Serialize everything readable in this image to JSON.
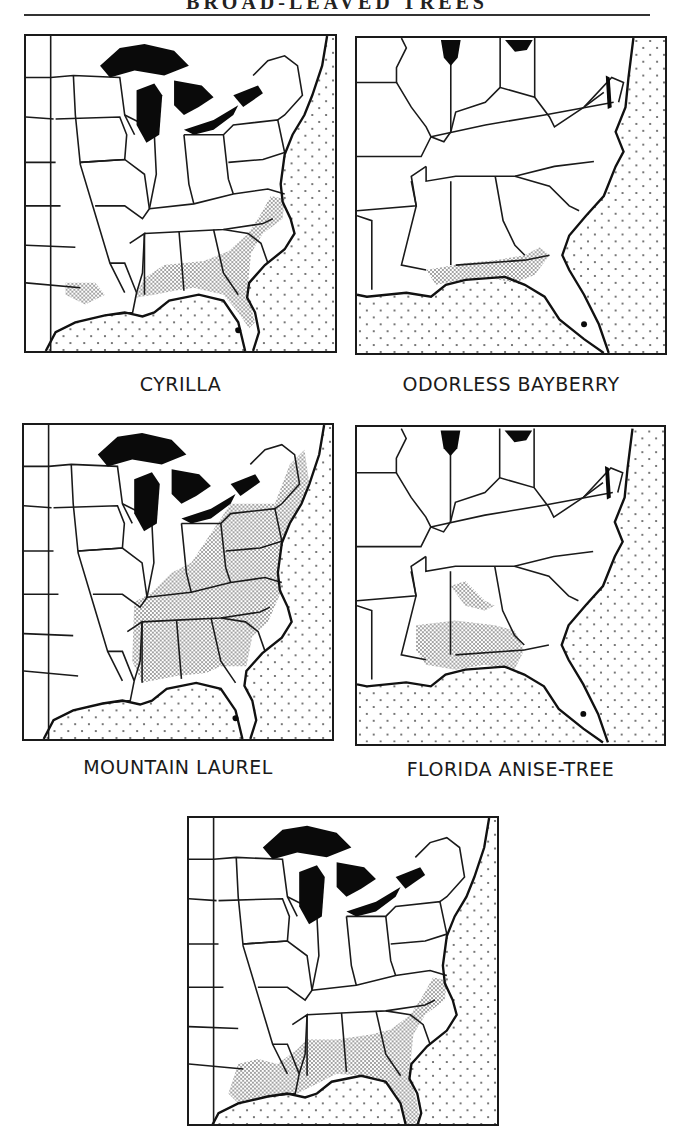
{
  "header": {
    "title": "BROAD-LEAVED TREES"
  },
  "colors": {
    "ink": "#1a1a1a",
    "paper": "#ffffff",
    "range_stipple": "#8a8a8a",
    "ocean_dots": "#555555"
  },
  "legend_semantics": {
    "dense_stipple": "species range",
    "sparse_dots": "ocean / water",
    "solid_black": "Great Lakes and lakes"
  },
  "maps": [
    {
      "id": "cyrilla",
      "caption": "CYRILLA",
      "extent": "eastern-us-full",
      "range_description": "Coastal plain from southeastern Virginia/North Carolina south through South Carolina, Georgia, northern Florida, southern Alabama, and west to eastern Texas"
    },
    {
      "id": "odorless-bayberry",
      "caption": "ODORLESS BAYBERRY",
      "extent": "southeastern-us",
      "range_description": "Narrow Gulf coast band from southeastern Louisiana and Mississippi across the Florida panhandle into southwestern Georgia"
    },
    {
      "id": "mountain-laurel",
      "caption": "MOUNTAIN LAUREL",
      "extent": "eastern-us-full",
      "range_description": "New England and New York south through Pennsylvania, the Appalachians, Ohio, Kentucky, Tennessee to Alabama, Georgia and the Carolinas"
    },
    {
      "id": "florida-anise-tree",
      "caption": "FLORIDA ANISE-TREE",
      "extent": "southeastern-us",
      "range_description": "Southern Alabama, southern Mississippi, southeastern Louisiana, and the Florida panhandle"
    },
    {
      "id": "fifth-species",
      "caption": "",
      "extent": "eastern-us-full",
      "range_description": "Coastal plain from southeastern Virginia through the Carolinas, Georgia, Florida, Alabama, Mississippi, and Louisiana into eastern Texas"
    }
  ]
}
